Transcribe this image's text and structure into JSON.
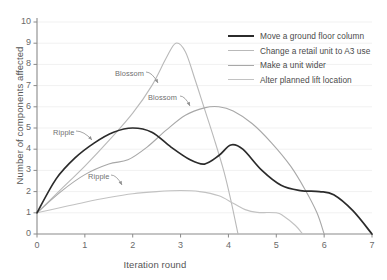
{
  "chart_data": {
    "type": "line",
    "title": "",
    "xlabel": "Iteration round",
    "ylabel": "Number of components affected",
    "xlim": [
      0,
      7
    ],
    "ylim": [
      0,
      10
    ],
    "xticks": [
      "0",
      "1",
      "2",
      "3",
      "4",
      "5",
      "6",
      "7"
    ],
    "yticks": [
      "0",
      "1",
      "2",
      "3",
      "4",
      "5",
      "6",
      "7",
      "8",
      "9",
      "10"
    ],
    "grid": "horizontal-faint",
    "legend_position": "top-right",
    "series": [
      {
        "name": "Move a ground floor column",
        "color": "#2b2b2b",
        "width": 1.7,
        "points": [
          [
            0,
            1.0
          ],
          [
            0.4,
            2.6
          ],
          [
            0.8,
            3.6
          ],
          [
            1.2,
            4.3
          ],
          [
            1.6,
            4.8
          ],
          [
            2.0,
            5.0
          ],
          [
            2.4,
            4.8
          ],
          [
            2.8,
            4.1
          ],
          [
            3.2,
            3.5
          ],
          [
            3.5,
            3.3
          ],
          [
            3.8,
            3.7
          ],
          [
            4.05,
            4.2
          ],
          [
            4.3,
            4.0
          ],
          [
            4.7,
            3.0
          ],
          [
            5.1,
            2.3
          ],
          [
            5.5,
            2.05
          ],
          [
            5.9,
            2.0
          ],
          [
            6.2,
            1.85
          ],
          [
            6.6,
            1.1
          ],
          [
            7.0,
            0.0
          ]
        ]
      },
      {
        "name": "Change a retail unit to A3 use",
        "color": "#b9b9b9",
        "width": 1.1,
        "points": [
          [
            0,
            1.0
          ],
          [
            0.5,
            2.1
          ],
          [
            1.0,
            3.2
          ],
          [
            1.5,
            4.4
          ],
          [
            2.0,
            5.7
          ],
          [
            2.4,
            7.0
          ],
          [
            2.7,
            8.3
          ],
          [
            2.9,
            9.0
          ],
          [
            3.1,
            8.6
          ],
          [
            3.3,
            7.3
          ],
          [
            3.5,
            5.9
          ],
          [
            3.7,
            4.5
          ],
          [
            3.9,
            3.0
          ],
          [
            4.05,
            1.6
          ],
          [
            4.2,
            0.0
          ]
        ]
      },
      {
        "name": "Make a unit wider",
        "color": "#a8a8a8",
        "width": 1.1,
        "points": [
          [
            0,
            1.0
          ],
          [
            0.5,
            2.0
          ],
          [
            1.0,
            2.8
          ],
          [
            1.5,
            3.3
          ],
          [
            1.9,
            3.5
          ],
          [
            2.3,
            4.1
          ],
          [
            2.7,
            4.9
          ],
          [
            3.1,
            5.6
          ],
          [
            3.5,
            5.95
          ],
          [
            3.8,
            6.0
          ],
          [
            4.1,
            5.8
          ],
          [
            4.5,
            5.2
          ],
          [
            4.9,
            4.3
          ],
          [
            5.3,
            3.2
          ],
          [
            5.6,
            2.1
          ],
          [
            5.85,
            1.0
          ],
          [
            6.0,
            0.0
          ]
        ]
      },
      {
        "name": "Alter planned lift location",
        "color": "#c2c2c2",
        "width": 1.1,
        "points": [
          [
            0,
            1.0
          ],
          [
            0.5,
            1.25
          ],
          [
            1.0,
            1.5
          ],
          [
            1.5,
            1.72
          ],
          [
            2.0,
            1.9
          ],
          [
            2.5,
            2.0
          ],
          [
            3.0,
            2.05
          ],
          [
            3.4,
            2.0
          ],
          [
            3.8,
            1.8
          ],
          [
            4.1,
            1.45
          ],
          [
            4.35,
            1.15
          ],
          [
            4.6,
            1.02
          ],
          [
            5.0,
            1.0
          ],
          [
            5.15,
            0.85
          ],
          [
            5.4,
            0.4
          ],
          [
            5.55,
            0.0
          ]
        ]
      }
    ],
    "annotations": [
      {
        "id": "ripple-upper",
        "label": "Ripple",
        "text_x": 53,
        "text_y": 128,
        "arrow_from_x": 76,
        "arrow_from_y": 131,
        "arrow_to_x": 92,
        "arrow_to_y": 140
      },
      {
        "id": "ripple-lower",
        "label": "Ripple",
        "text_x": 88,
        "text_y": 172,
        "arrow_from_x": 111,
        "arrow_from_y": 175,
        "arrow_to_x": 122,
        "arrow_to_y": 185
      },
      {
        "id": "blossom-upper",
        "label": "Blossom",
        "text_x": 115,
        "text_y": 69,
        "arrow_from_x": 146,
        "arrow_from_y": 72,
        "arrow_to_x": 158,
        "arrow_to_y": 83
      },
      {
        "id": "blossom-lower",
        "label": "Blossom",
        "text_x": 148,
        "text_y": 93,
        "arrow_from_x": 180,
        "arrow_from_y": 96,
        "arrow_to_x": 190,
        "arrow_to_y": 106
      }
    ]
  },
  "axes": {
    "x_title": "Iteration round",
    "y_title": "Number of components affected"
  }
}
